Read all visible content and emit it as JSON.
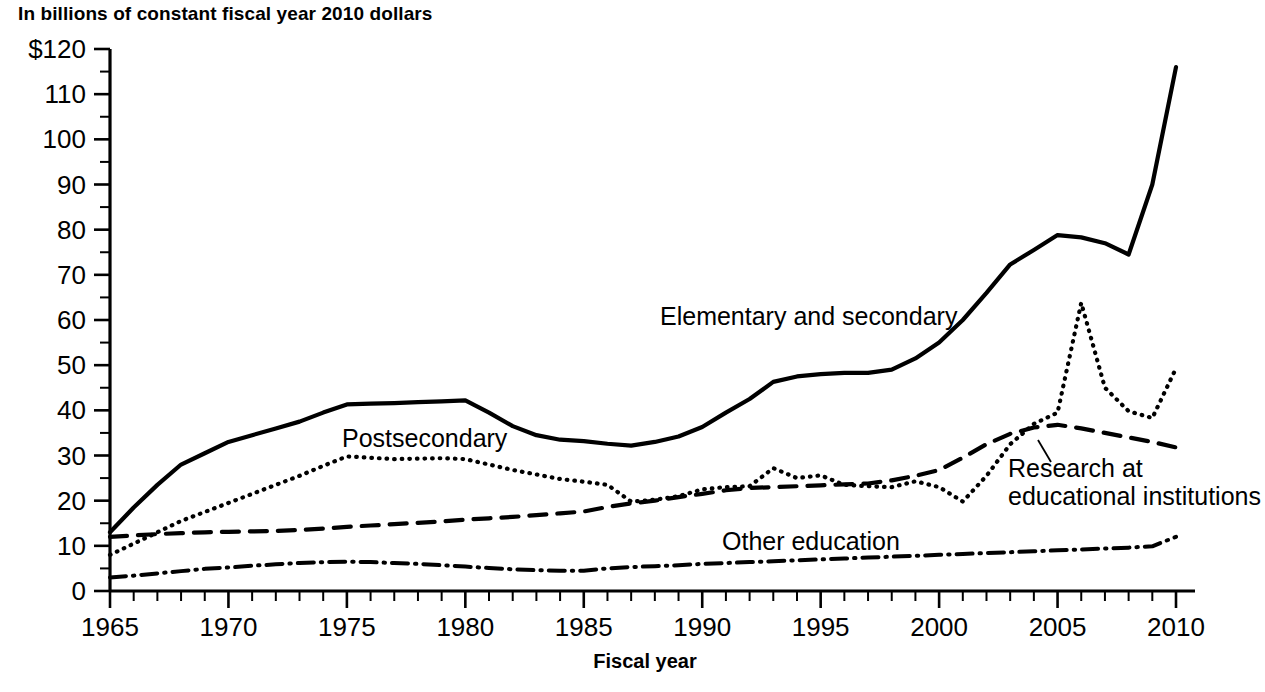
{
  "title": "In billions of constant fiscal year 2010 dollars",
  "axis": {
    "x_title": "Fiscal year",
    "y_tick_labels": [
      "$120",
      "110",
      "100",
      "90",
      "80",
      "70",
      "60",
      "50",
      "40",
      "30",
      "20",
      "10",
      "0"
    ],
    "x_tick_labels": [
      "1965",
      "1970",
      "1975",
      "1980",
      "1985",
      "1990",
      "1995",
      "2000",
      "2005",
      "2010"
    ]
  },
  "series_labels": {
    "elementary": "Elementary and secondary",
    "postsecondary": "Postsecondary",
    "other": "Other education",
    "research_line1": "Research at",
    "research_line2": "educational institutions"
  },
  "colors": {
    "ink": "#000000",
    "background": "#ffffff"
  },
  "chart_data": {
    "type": "line",
    "title": "In billions of constant fiscal year 2010 dollars",
    "xlabel": "Fiscal year",
    "ylabel": "In billions of constant fiscal year 2010 dollars",
    "xlim": [
      1965,
      2010
    ],
    "ylim": [
      0,
      120
    ],
    "ytick_step": 10,
    "yminor_step": 5,
    "xtick_step": 5,
    "xminor_step": 1,
    "grid": false,
    "legend": "inline-annotations",
    "x": [
      1965,
      1966,
      1967,
      1968,
      1969,
      1970,
      1971,
      1972,
      1973,
      1974,
      1975,
      1976,
      1977,
      1978,
      1979,
      1980,
      1981,
      1982,
      1983,
      1984,
      1985,
      1986,
      1987,
      1988,
      1989,
      1990,
      1991,
      1992,
      1993,
      1994,
      1995,
      1996,
      1997,
      1998,
      1999,
      2000,
      2001,
      2002,
      2003,
      2004,
      2005,
      2006,
      2007,
      2008,
      2009,
      2010
    ],
    "series": [
      {
        "name": "Elementary and secondary",
        "style": "solid",
        "values": [
          13.0,
          18.5,
          23.5,
          28.0,
          30.5,
          33.0,
          34.5,
          36.0,
          37.5,
          39.5,
          41.3,
          41.5,
          41.6,
          41.8,
          42.0,
          42.2,
          39.5,
          36.5,
          34.5,
          33.5,
          33.2,
          32.6,
          32.2,
          33.0,
          34.2,
          36.3,
          39.5,
          42.5,
          46.3,
          47.5,
          48.0,
          48.3,
          48.3,
          49.0,
          51.5,
          55.0,
          60.0,
          66.0,
          72.3,
          75.5,
          78.8,
          78.3,
          77.0,
          74.5,
          90.0,
          116.0
        ]
      },
      {
        "name": "Postsecondary",
        "style": "dotted",
        "values": [
          8.0,
          10.5,
          13.0,
          15.5,
          17.5,
          19.5,
          21.5,
          23.5,
          25.5,
          27.7,
          29.8,
          29.5,
          29.2,
          29.3,
          29.4,
          29.2,
          28.0,
          26.8,
          25.8,
          24.8,
          24.2,
          23.5,
          19.8,
          20.2,
          21.0,
          22.5,
          23.0,
          23.2,
          27.2,
          25.0,
          25.6,
          23.5,
          23.2,
          23.0,
          24.3,
          23.0,
          19.8,
          25.5,
          32.5,
          37.0,
          39.5,
          63.8,
          45.0,
          39.8,
          38.3,
          49.3
        ]
      },
      {
        "name": "Research at educational institutions",
        "style": "dashed",
        "values": [
          12.0,
          12.3,
          12.6,
          12.8,
          13.0,
          13.1,
          13.2,
          13.3,
          13.5,
          13.8,
          14.2,
          14.5,
          14.8,
          15.1,
          15.4,
          15.8,
          16.1,
          16.4,
          16.8,
          17.2,
          17.6,
          18.6,
          19.4,
          20.0,
          20.8,
          21.5,
          22.3,
          22.8,
          23.0,
          23.2,
          23.4,
          23.6,
          23.8,
          24.5,
          25.5,
          26.8,
          29.5,
          32.5,
          34.8,
          36.2,
          36.8,
          36.0,
          35.0,
          34.0,
          33.0,
          31.8
        ]
      },
      {
        "name": "Other education",
        "style": "dashdot",
        "values": [
          3.0,
          3.4,
          3.9,
          4.4,
          4.9,
          5.2,
          5.6,
          5.9,
          6.2,
          6.4,
          6.5,
          6.4,
          6.2,
          6.0,
          5.7,
          5.4,
          5.1,
          4.8,
          4.6,
          4.5,
          4.5,
          5.0,
          5.3,
          5.5,
          5.7,
          6.0,
          6.2,
          6.4,
          6.6,
          6.8,
          7.0,
          7.2,
          7.4,
          7.6,
          7.8,
          8.0,
          8.2,
          8.4,
          8.6,
          8.8,
          9.0,
          9.2,
          9.4,
          9.6,
          9.9,
          12.0
        ]
      }
    ]
  }
}
